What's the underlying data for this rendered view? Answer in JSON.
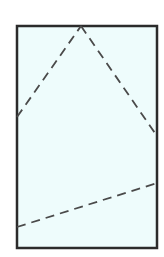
{
  "diagram": {
    "frame": {
      "x": 17,
      "y": 26,
      "width": 140,
      "height": 222,
      "fill": "#eefcfc",
      "stroke": "#2b2b2b",
      "stroke_width": 2.5
    },
    "dashed_lines": [
      {
        "name": "left-fold-line",
        "x1": 17,
        "y1": 117,
        "x2": 81,
        "y2": 26
      },
      {
        "name": "right-fold-line",
        "x1": 81,
        "y1": 26,
        "x2": 157,
        "y2": 136
      },
      {
        "name": "bottom-fold-line",
        "x1": 17,
        "y1": 227,
        "x2": 157,
        "y2": 183
      }
    ],
    "dash_color": "#4a4a4a",
    "dash_pattern": "9,6"
  }
}
